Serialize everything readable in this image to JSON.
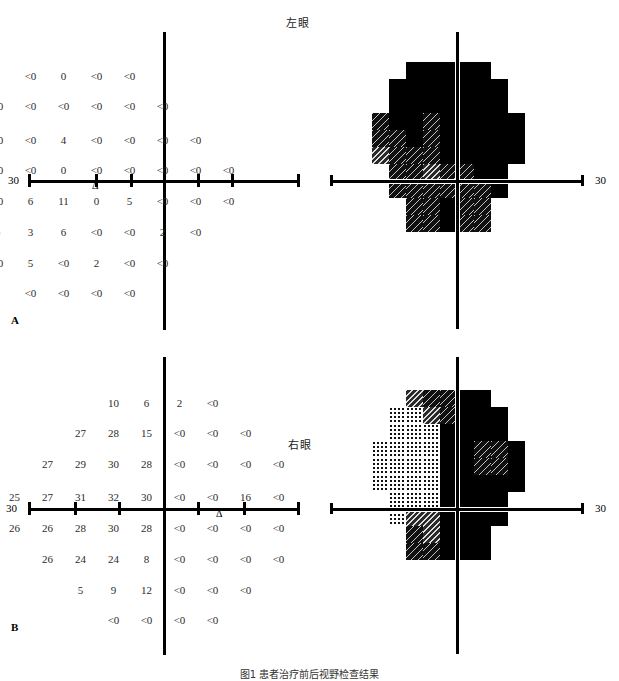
{
  "figure": {
    "caption": "图1  患者治疗前后视野检查结果",
    "panels": [
      {
        "letter": "A",
        "eye_label": "左眼",
        "axis_label_left": "30",
        "axis_label_right": "30",
        "blindspot_marker": "Δ",
        "rows": [
          {
            "offset": 3,
            "values": [
              "<0",
              "0",
              "<0",
              "<0"
            ]
          },
          {
            "offset": 2,
            "values": [
              "<0",
              "<0",
              "<0",
              "<0",
              "<0",
              "<0"
            ]
          },
          {
            "offset": 1,
            "values": [
              "0",
              "<0",
              "<0",
              "4",
              "<0",
              "<0",
              "<0",
              "<0"
            ]
          },
          {
            "offset": 0,
            "values": [
              "9",
              "<0",
              "<0",
              "0",
              "<0",
              "<0",
              "<0",
              "<0",
              "<0"
            ]
          },
          {
            "offset": 0,
            "values": [
              "19",
              "<0",
              "6",
              "11",
              "0",
              "5",
              "<0",
              "<0",
              "<0"
            ]
          },
          {
            "offset": 1,
            "values": [
              "12",
              "6",
              "3",
              "6",
              "<0",
              "<0",
              "2",
              "<0"
            ]
          },
          {
            "offset": 2,
            "values": [
              "<0",
              "5",
              "<0",
              "2",
              "<0",
              "<0"
            ]
          },
          {
            "offset": 3,
            "values": [
              "<0",
              "<0",
              "<0",
              "<0"
            ]
          }
        ],
        "graymap": [
          [
            6,
            6,
            6,
            6,
            6,
            6,
            6,
            6,
            6
          ],
          [
            6,
            6,
            6,
            6,
            6,
            6,
            6,
            6,
            6
          ],
          [
            6,
            6,
            6,
            6,
            6,
            6,
            6,
            6,
            6
          ],
          [
            5,
            6,
            6,
            5,
            6,
            6,
            6,
            6,
            6
          ],
          [
            5,
            5,
            6,
            5,
            6,
            6,
            6,
            6,
            6
          ],
          [
            4,
            5,
            5,
            5,
            6,
            6,
            6,
            6,
            6
          ],
          [
            4,
            5,
            5,
            4,
            5,
            5,
            6,
            6,
            6
          ],
          [
            5,
            5,
            5,
            5,
            5,
            5,
            5,
            6,
            6
          ],
          [
            6,
            5,
            5,
            5,
            6,
            5,
            5,
            6,
            6
          ],
          [
            6,
            6,
            5,
            5,
            6,
            5,
            5,
            6,
            6
          ]
        ]
      },
      {
        "letter": "B",
        "eye_label": "右眼",
        "axis_label_left": "30",
        "axis_label_right": "30",
        "blindspot_marker": "Δ",
        "rows": [
          {
            "offset": 3,
            "values": [
              "10",
              "6",
              "2",
              "<0"
            ]
          },
          {
            "offset": 2,
            "values": [
              "27",
              "28",
              "15",
              "<0",
              "<0",
              "<0"
            ]
          },
          {
            "offset": 1,
            "values": [
              "27",
              "29",
              "30",
              "28",
              "<0",
              "<0",
              "<0",
              "<0"
            ]
          },
          {
            "offset": 0,
            "values": [
              "25",
              "27",
              "31",
              "32",
              "30",
              "<0",
              "<0",
              "16",
              "<0"
            ]
          },
          {
            "offset": 0,
            "values": [
              "26",
              "26",
              "28",
              "30",
              "28",
              "<0",
              "<0",
              "<0",
              "<0"
            ]
          },
          {
            "offset": 1,
            "values": [
              "26",
              "24",
              "24",
              "8",
              "<0",
              "<0",
              "<0",
              "<0"
            ]
          },
          {
            "offset": 2,
            "values": [
              "5",
              "9",
              "12",
              "<0",
              "<0",
              "<0"
            ]
          },
          {
            "offset": 3,
            "values": [
              "<0",
              "<0",
              "<0",
              "<0"
            ]
          }
        ],
        "graymap": [
          [
            2,
            3,
            4,
            5,
            5,
            6,
            6,
            6,
            6
          ],
          [
            1,
            1,
            2,
            4,
            5,
            6,
            6,
            6,
            6
          ],
          [
            1,
            1,
            1,
            2,
            6,
            6,
            6,
            6,
            6
          ],
          [
            1,
            1,
            1,
            2,
            6,
            6,
            5,
            5,
            6
          ],
          [
            1,
            1,
            1,
            1,
            6,
            6,
            5,
            5,
            6
          ],
          [
            1,
            1,
            1,
            1,
            6,
            6,
            6,
            6,
            6
          ],
          [
            1,
            1,
            1,
            2,
            6,
            6,
            6,
            6,
            6
          ],
          [
            1,
            2,
            4,
            4,
            6,
            6,
            6,
            6,
            6
          ],
          [
            2,
            4,
            5,
            4,
            6,
            6,
            6,
            6,
            6
          ],
          [
            3,
            5,
            5,
            5,
            6,
            6,
            6,
            6,
            6
          ]
        ]
      }
    ]
  }
}
